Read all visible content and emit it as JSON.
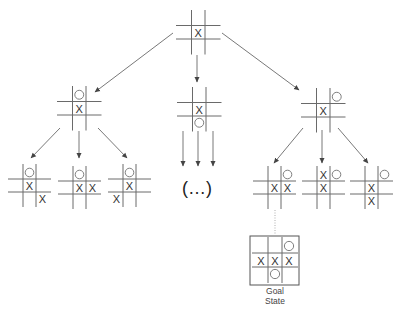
{
  "diagram": {
    "colors": {
      "line": "#6a6a6a",
      "mark": "#333333",
      "arrow": "#555555"
    },
    "boards": [
      {
        "id": "root",
        "x": 178,
        "y": 12,
        "cell": 13.5,
        "cells": [
          "",
          "",
          "",
          "",
          "X",
          "",
          "",
          "",
          ""
        ]
      },
      {
        "id": "level1-left",
        "x": 59,
        "y": 88,
        "cell": 13.5,
        "cells": [
          "",
          "O",
          "",
          "",
          "X",
          "",
          "",
          "",
          ""
        ]
      },
      {
        "id": "level1-middle",
        "x": 179,
        "y": 89,
        "cell": 13.5,
        "cells": [
          "",
          "",
          "",
          "",
          "X",
          "",
          "",
          "O",
          ""
        ]
      },
      {
        "id": "level1-right",
        "x": 303,
        "y": 90,
        "cell": 13.5,
        "cells": [
          "",
          "",
          "O",
          "",
          "X",
          "",
          "",
          "",
          ""
        ]
      },
      {
        "id": "level2-1",
        "x": 10,
        "y": 166,
        "cell": 13,
        "cells": [
          "",
          "O",
          "",
          "",
          "X",
          "",
          "",
          "",
          "X"
        ]
      },
      {
        "id": "level2-2",
        "x": 60,
        "y": 168,
        "cell": 13,
        "cells": [
          "",
          "O",
          "",
          "",
          "X",
          "X",
          "",
          "",
          ""
        ]
      },
      {
        "id": "level2-3",
        "x": 110,
        "y": 166,
        "cell": 13,
        "cells": [
          "",
          "O",
          "",
          "",
          "X",
          "",
          "X",
          "",
          ""
        ]
      },
      {
        "id": "level2-4",
        "x": 255,
        "y": 168,
        "cell": 13,
        "cells": [
          "",
          "",
          "O",
          "",
          "X",
          "X",
          "",
          "",
          ""
        ]
      },
      {
        "id": "level2-5",
        "x": 304,
        "y": 168,
        "cell": 13,
        "cells": [
          "",
          "X",
          "O",
          "",
          "X",
          "",
          "",
          "",
          ""
        ]
      },
      {
        "id": "level2-6",
        "x": 352,
        "y": 168,
        "cell": 13,
        "cells": [
          "",
          "",
          "O",
          "",
          "X",
          "",
          "",
          "X",
          ""
        ]
      },
      {
        "id": "goal",
        "x": 254,
        "y": 239,
        "cell": 14,
        "cells": [
          "",
          "",
          "O",
          "X",
          "X",
          "X",
          "",
          "O",
          ""
        ]
      }
    ],
    "arrows": [
      {
        "from": [
          173,
          33
        ],
        "to": [
          95,
          92
        ]
      },
      {
        "from": [
          197,
          55
        ],
        "to": [
          197,
          82
        ]
      },
      {
        "from": [
          222,
          33
        ],
        "to": [
          299,
          90
        ]
      },
      {
        "from": [
          60,
          128
        ],
        "to": [
          31,
          158
        ]
      },
      {
        "from": [
          79,
          131
        ],
        "to": [
          79,
          158
        ]
      },
      {
        "from": [
          98,
          128
        ],
        "to": [
          127,
          158
        ]
      },
      {
        "from": [
          183,
          131
        ],
        "to": [
          183,
          166
        ]
      },
      {
        "from": [
          198,
          131
        ],
        "to": [
          198,
          166
        ]
      },
      {
        "from": [
          213,
          131
        ],
        "to": [
          213,
          166
        ]
      },
      {
        "from": [
          303,
          128
        ],
        "to": [
          274,
          163
        ]
      },
      {
        "from": [
          322,
          130
        ],
        "to": [
          322,
          163
        ]
      },
      {
        "from": [
          338,
          128
        ],
        "to": [
          368,
          163
        ]
      }
    ],
    "dotted_link": {
      "from": [
        275,
        210
      ],
      "to": [
        275,
        234
      ]
    },
    "goal_box": {
      "x": 250,
      "y": 236,
      "w": 49,
      "h": 49
    },
    "ellipsis": {
      "text": "(…)",
      "x": 197,
      "y": 188
    },
    "goal_caption": {
      "line1": "Goal",
      "line2": "State",
      "x": 275,
      "y1": 291,
      "y2": 301
    }
  }
}
